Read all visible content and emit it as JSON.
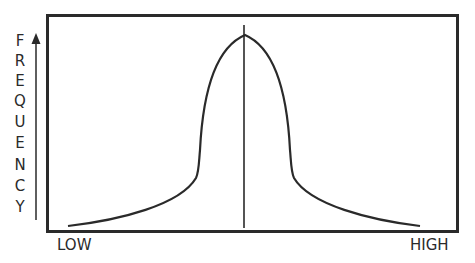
{
  "diagram": {
    "type": "bell-shaped frequency distribution",
    "y_axis_label": "FREQUENCY",
    "y_axis_letters": [
      "F",
      "R",
      "E",
      "Q",
      "U",
      "E",
      "N",
      "C",
      "Y"
    ],
    "x_axis": {
      "low_label": "LOW",
      "high_label": "HIGH"
    },
    "elements": [
      "bordered plot frame",
      "upward y-axis arrow",
      "symmetric peaked curve",
      "vertical center line at peak"
    ],
    "colors": {
      "line": "#2a2a2a",
      "background": "#ffffff"
    }
  }
}
